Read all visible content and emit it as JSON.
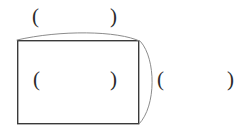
{
  "figure": {
    "background_color": "#ffffff",
    "width": 249,
    "height": 136,
    "rectangle": {
      "name": "main-rectangle",
      "x": 17,
      "y": 40,
      "width": 122,
      "height": 84,
      "stroke_color": "#3a3a3a",
      "stroke_width": 1.4,
      "fill": "none"
    },
    "arc": {
      "name": "sweeping-arc",
      "stroke_color": "#8c8c8c",
      "stroke_width": 1,
      "fill": "none",
      "path": "M 17 40 C 60 30, 118 30, 140 41 C 156 58, 156 106, 139 124",
      "description": "thin grey curve from the top-left corner, bowing up over the top edge, then bulging outward down the right side to the bottom-right corner"
    },
    "groups": [
      {
        "name": "paren-group-top",
        "open": "(",
        "close": ")",
        "position": "above-rectangle"
      },
      {
        "name": "paren-group-middle",
        "open": "(",
        "close": ")",
        "position": "inside-rectangle"
      },
      {
        "name": "paren-group-right",
        "open": "(",
        "close": ")",
        "position": "right-of-rectangle"
      }
    ]
  }
}
